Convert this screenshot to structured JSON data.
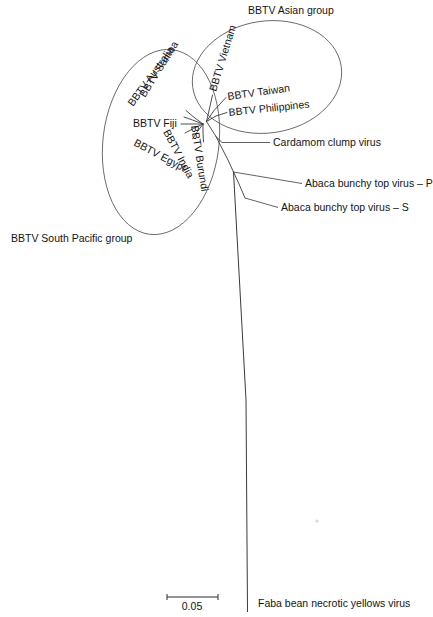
{
  "figure": {
    "kind": "unrooted-phylogenetic-tree",
    "background_color": "#ffffff",
    "line_color": "#3a3a3a",
    "text_color": "#141414"
  },
  "groups": [
    {
      "id": "asian",
      "label": "BBTV Asian group",
      "label_x": 248,
      "label_y": 14,
      "ellipse": {
        "cx": 267,
        "cy": 77,
        "rx": 75,
        "ry": 56,
        "rotate": -8
      }
    },
    {
      "id": "south-pacific",
      "label": "BBTV South Pacific group",
      "label_x": 11,
      "label_y": 242,
      "ellipse": {
        "cx": 161,
        "cy": 142,
        "rx": 58,
        "ry": 93,
        "rotate": 7
      }
    }
  ],
  "tips": [
    {
      "id": "bbtv-vietnam",
      "label": "BBTV Vietnam",
      "group": "asian",
      "text_x": 216,
      "text_y": 92,
      "rotate": -73,
      "anchor": "start",
      "branch": [
        [
          206.5,
          121.5
        ],
        [
          210.5,
          104.0
        ],
        [
          212.5,
          95.0
        ]
      ]
    },
    {
      "id": "bbtv-taiwan",
      "label": "BBTV Taiwan",
      "group": "asian",
      "text_x": 228,
      "text_y": 100,
      "rotate": -8,
      "anchor": "start",
      "branch": [
        [
          206.5,
          121.5
        ],
        [
          214.0,
          110.5
        ],
        [
          226.0,
          97.5
        ]
      ]
    },
    {
      "id": "bbtv-philippines",
      "label": "BBTV Philippines",
      "group": "asian",
      "text_x": 229,
      "text_y": 116,
      "rotate": -6,
      "anchor": "start",
      "branch": [
        [
          206.5,
          121.5
        ],
        [
          216.0,
          116.0
        ],
        [
          227.0,
          112.5
        ]
      ]
    },
    {
      "id": "bbtv-samoa",
      "label": "BBTV Samoa",
      "group": "south-pacific",
      "text_x": 145,
      "text_y": 98,
      "rotate": -58,
      "anchor": "start",
      "branch": [
        [
          203.0,
          124.0
        ],
        [
          193.0,
          116.5
        ],
        [
          186.0,
          110.5
        ]
      ]
    },
    {
      "id": "bbtv-australia",
      "label": "BBTV Australia",
      "group": "south-pacific",
      "text_x": 133,
      "text_y": 107,
      "rotate": -54,
      "anchor": "start",
      "branch": [
        [
          203.0,
          124.0
        ],
        [
          192.5,
          120.0
        ],
        [
          184.0,
          117.0
        ]
      ]
    },
    {
      "id": "bbtv-fiji",
      "label": "BBTV Fiji",
      "group": "south-pacific",
      "text_x": 133,
      "text_y": 127,
      "rotate": 0,
      "anchor": "start",
      "branch": [
        [
          203.0,
          124.0
        ],
        [
          192.0,
          124.0
        ],
        [
          181.0,
          124.0
        ]
      ]
    },
    {
      "id": "bbtv-egypt",
      "label": "BBTV Egypt",
      "group": "south-pacific",
      "text_x": 133,
      "text_y": 145,
      "rotate": 28,
      "anchor": "start",
      "branch": [
        [
          203.0,
          124.0
        ],
        [
          193.5,
          128.5
        ],
        [
          185.0,
          133.0
        ]
      ]
    },
    {
      "id": "bbtv-india",
      "label": "BBTV India",
      "group": "south-pacific",
      "text_x": 163,
      "text_y": 132,
      "rotate": 62,
      "anchor": "start",
      "branch": [
        [
          203.0,
          124.0
        ],
        [
          197.5,
          131.5
        ],
        [
          192.5,
          139.0
        ]
      ]
    },
    {
      "id": "bbtv-burundi",
      "label": "BBTV Burundi",
      "group": "south-pacific",
      "text_x": 191,
      "text_y": 126,
      "rotate": 81,
      "anchor": "start",
      "branch": [
        [
          203.0,
          124.0
        ],
        [
          203.0,
          133.0
        ],
        [
          203.5,
          142.0
        ]
      ]
    }
  ],
  "outer_taxa": [
    {
      "id": "cardamom-clump-virus",
      "label": "Cardamom clump virus",
      "text_x": 273,
      "text_y": 146,
      "branch": [
        [
          206.5,
          121.5
        ],
        [
          216.0,
          136.5
        ],
        [
          222.0,
          142.5
        ]
      ],
      "leader": [
        [
          222.0,
          142.5
        ],
        [
          270.0,
          142.5
        ]
      ]
    },
    {
      "id": "abaca-bunchy-top-virus-p",
      "label": "Abaca bunchy top virus – P",
      "text_x": 305,
      "text_y": 187,
      "branch": [
        [
          216.0,
          136.5
        ],
        [
          228.0,
          160.0
        ],
        [
          233.5,
          172.0
        ]
      ],
      "leader": [
        [
          233.5,
          172.0
        ],
        [
          302.0,
          183.5
        ]
      ]
    },
    {
      "id": "abaca-bunchy-top-virus-s",
      "label": "Abaca bunchy top virus – S",
      "text_x": 281,
      "text_y": 211,
      "branch": [
        [
          233.5,
          172.0
        ],
        [
          239.0,
          184.0
        ],
        [
          245.0,
          198.0
        ]
      ],
      "leader": [
        [
          245.0,
          198.0
        ],
        [
          278.0,
          207.5
        ]
      ]
    },
    {
      "id": "faba-bean-necrotic-yellows-virus",
      "label": "Faba bean necrotic yellows virus",
      "text_x": 258,
      "text_y": 607,
      "trunk": [
        [
          233.5,
          172.0
        ],
        [
          246.0,
          400.0
        ],
        [
          247.5,
          612.0
        ]
      ]
    }
  ],
  "scale_bar": {
    "label": "0.05",
    "x1": 167,
    "x2": 218,
    "y": 597,
    "tick_height": 6,
    "label_x": 192,
    "label_y": 610
  }
}
